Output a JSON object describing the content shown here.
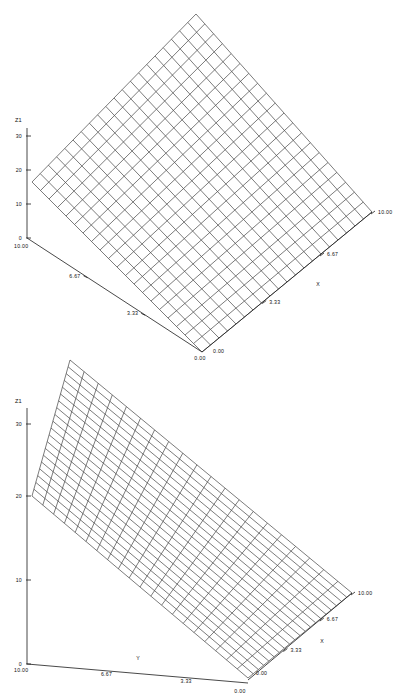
{
  "figure": {
    "type": "two-panel-3d-surface-wireframe",
    "background_color": "#ffffff",
    "line_color": "#2b2b2b",
    "axis_color": "#1a1a1a"
  },
  "chart_data": [
    {
      "type": "surface",
      "panel_index": 0,
      "title": "",
      "xlabel": "X",
      "ylabel": "",
      "zlabel": "Z1",
      "xlim": [
        0,
        10
      ],
      "ylim": [
        0,
        10
      ],
      "zlim": [
        0,
        30
      ],
      "xticks": [
        "0.00",
        "3.33",
        "6.67",
        "10.00"
      ],
      "yticks": [
        "0.00",
        "3.33",
        "6.67",
        "10.00"
      ],
      "zticks": [
        "0",
        "10",
        "20",
        "30"
      ],
      "grid": true,
      "legend": "none",
      "mesh_rows": 20,
      "mesh_cols": 20,
      "surface_note": "flat inclined plane rendered as square wireframe mesh, viewed from an elevated corner, diamond silhouette",
      "plane_corner_z": {
        "x0_y0": 0.0,
        "x10_y0": 20.0,
        "x0_y10": 20.0,
        "x10_y10": 40.0
      }
    },
    {
      "type": "surface",
      "panel_index": 1,
      "title": "",
      "xlabel": "X",
      "ylabel": "Y",
      "zlabel": "Z1",
      "xlim": [
        0,
        10
      ],
      "ylim": [
        0,
        10
      ],
      "zlim": [
        0,
        30
      ],
      "xticks": [
        "0.00",
        "3.33",
        "6.67",
        "10.00"
      ],
      "yticks": [
        "0.00",
        "3.33",
        "6.67",
        "10.00"
      ],
      "zticks": [
        "0",
        "10",
        "20",
        "30"
      ],
      "grid": true,
      "legend": "none",
      "mesh_rows": 20,
      "mesh_cols": 20,
      "surface_note": "flat inclined plane rendered as wireframe mesh, skewed rectangular silhouette, steeper tilt than panel 0",
      "plane_corner_z": {
        "x0_y0": 0.0,
        "x10_y0": 22.0,
        "x0_y10": 20.0,
        "x10_y10": 42.0
      }
    }
  ],
  "panels": [
    {
      "id": "panel-top",
      "z_axis": {
        "name": "Z1",
        "ticks": [
          {
            "label": "30"
          },
          {
            "label": "20"
          },
          {
            "label": "10"
          },
          {
            "label": "0"
          }
        ]
      },
      "y_axis": {
        "name": "",
        "ticks": [
          {
            "label": "10.00"
          },
          {
            "label": "6.67"
          },
          {
            "label": "3.33"
          },
          {
            "label": "0.00"
          }
        ]
      },
      "x_axis": {
        "name": "X",
        "ticks": [
          {
            "label": "0.00"
          },
          {
            "label": "3.33"
          },
          {
            "label": "6.67"
          },
          {
            "label": "10.00"
          }
        ]
      }
    },
    {
      "id": "panel-bottom",
      "z_axis": {
        "name": "Z1",
        "ticks": [
          {
            "label": "30"
          },
          {
            "label": "20"
          },
          {
            "label": "10"
          },
          {
            "label": "0"
          }
        ]
      },
      "y_axis": {
        "name": "Y",
        "ticks": [
          {
            "label": "10.00"
          },
          {
            "label": "6.67"
          },
          {
            "label": "3.33"
          },
          {
            "label": "0.00"
          }
        ]
      },
      "x_axis": {
        "name": "X",
        "ticks": [
          {
            "label": "0.00"
          },
          {
            "label": "3.33"
          },
          {
            "label": "6.67"
          },
          {
            "label": "10.00"
          }
        ]
      }
    }
  ]
}
